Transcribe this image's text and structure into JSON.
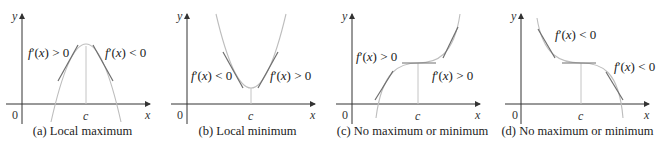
{
  "colors": {
    "axis": "#333333",
    "curve": "#bdbdbd",
    "tangent": "#6e6e6e",
    "vline": "#c4c4c4",
    "text": "#222222"
  },
  "panels": [
    {
      "id": "a",
      "caption": "(a) Local maximum",
      "labels": {
        "y_axis": "y",
        "x_axis": "x",
        "origin": "0",
        "c": "c",
        "left": "f′(x) > 0",
        "right": "f′(x) < 0"
      }
    },
    {
      "id": "b",
      "caption": "(b) Local minimum",
      "labels": {
        "y_axis": "y",
        "x_axis": "x",
        "origin": "0",
        "c": "c",
        "left": "f′(x) < 0",
        "right": "f′(x) > 0"
      }
    },
    {
      "id": "c",
      "caption": "(c) No maximum or minimum",
      "labels": {
        "y_axis": "y",
        "x_axis": "x",
        "origin": "0",
        "c": "c",
        "left": "f′(x) > 0",
        "right": "f′(x) > 0"
      }
    },
    {
      "id": "d",
      "caption": "(d) No maximum or minimum",
      "labels": {
        "y_axis": "y",
        "x_axis": "x",
        "origin": "0",
        "c": "c",
        "left": "f′(x) < 0",
        "right": "f′(x) < 0"
      }
    }
  ]
}
